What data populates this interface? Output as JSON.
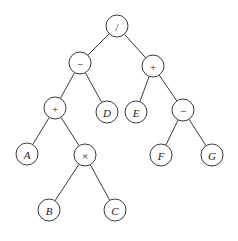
{
  "diagram": {
    "type": "expression-tree",
    "radius": 11,
    "nodes": [
      {
        "id": "n_div",
        "label": "/",
        "kind": "op",
        "x": 117,
        "y": 26
      },
      {
        "id": "n_sub1",
        "label": "−",
        "kind": "op",
        "x": 80,
        "y": 63
      },
      {
        "id": "n_add2",
        "label": "+",
        "kind": "op",
        "x": 153,
        "y": 66
      },
      {
        "id": "n_add1",
        "label": "+",
        "kind": "op",
        "x": 55,
        "y": 108
      },
      {
        "id": "n_D",
        "label": "D",
        "kind": "var",
        "x": 107,
        "y": 112
      },
      {
        "id": "n_E",
        "label": "E",
        "kind": "var",
        "x": 136,
        "y": 112
      },
      {
        "id": "n_sub2",
        "label": "−",
        "kind": "op",
        "x": 183,
        "y": 110
      },
      {
        "id": "n_A",
        "label": "A",
        "kind": "var",
        "x": 27,
        "y": 154
      },
      {
        "id": "n_mul",
        "label": "×",
        "kind": "op",
        "x": 85,
        "y": 155
      },
      {
        "id": "n_F",
        "label": "F",
        "kind": "var",
        "x": 161,
        "y": 155
      },
      {
        "id": "n_G",
        "label": "G",
        "kind": "var",
        "x": 212,
        "y": 155
      },
      {
        "id": "n_B",
        "label": "B",
        "kind": "var",
        "x": 49,
        "y": 210
      },
      {
        "id": "n_C",
        "label": "C",
        "kind": "var",
        "x": 115,
        "y": 210
      }
    ],
    "edges": [
      [
        "n_div",
        "n_sub1"
      ],
      [
        "n_div",
        "n_add2"
      ],
      [
        "n_sub1",
        "n_add1"
      ],
      [
        "n_sub1",
        "n_D"
      ],
      [
        "n_add2",
        "n_E"
      ],
      [
        "n_add2",
        "n_sub2"
      ],
      [
        "n_add1",
        "n_A"
      ],
      [
        "n_add1",
        "n_mul"
      ],
      [
        "n_sub2",
        "n_F"
      ],
      [
        "n_sub2",
        "n_G"
      ],
      [
        "n_mul",
        "n_B"
      ],
      [
        "n_mul",
        "n_C"
      ]
    ],
    "expression": "(A + B × C − D) / (E + (F − G))"
  }
}
